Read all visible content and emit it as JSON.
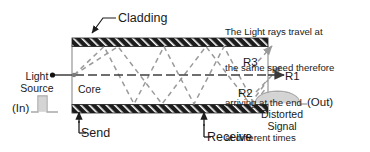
{
  "diagram": {
    "title_note": {
      "lines": [
        "The Light rays travel at",
        "the same speed therefore",
        "arriving at the end",
        "at different times"
      ]
    },
    "labels": {
      "cladding": "Cladding",
      "core": "Core",
      "send": "Send",
      "receive": "Receive",
      "light_source": "Light\nSource",
      "input_signal": "(In)",
      "output_signal": "(Out)",
      "distorted_signal": "Distorted\nSignal",
      "ray_1": "R1",
      "ray_2": "R2",
      "ray_3": "R3"
    },
    "colors": {
      "cladding_fill": "#1c1c1c",
      "cladding_hatch": "#ffffff",
      "core_fill": "#ffffff",
      "ray_dashed": "#9a9a9a",
      "ray_solid": "#4a4a4a",
      "outline": "#8c8c8c",
      "text": "#1a1a1a",
      "pulse_fill": "#d4d4d4",
      "pulse_stroke": "#a8a8a8"
    },
    "geometry": {
      "fiber_left_x": 72,
      "fiber_right_x": 268,
      "cladding_top_y": 38,
      "cladding_top_h": 8,
      "cladding_bottom_y": 105,
      "cladding_bottom_h": 8,
      "core_axis_y": 75
    },
    "icons": {
      "source_dot": "source-dot",
      "input_pulse": "square-pulse-waveform",
      "output_pulse": "rounded-dome-waveform",
      "leader_arrow": "arrowhead"
    }
  }
}
